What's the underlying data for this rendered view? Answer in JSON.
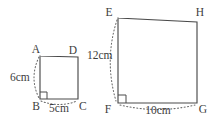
{
  "figure": {
    "background_color": "#ffffff",
    "stroke_color": "#4a4a4a",
    "dotted_color": "#6b6b6b",
    "text_color": "#3d3d3d",
    "shapes": [
      {
        "name": "small-quadrilateral",
        "vertices": [
          {
            "label": "A",
            "x": 40,
            "y": 56,
            "label_x": 36,
            "label_y": 53
          },
          {
            "label": "D",
            "x": 78,
            "y": 57,
            "label_x": 73,
            "label_y": 54
          },
          {
            "label": "C",
            "x": 78,
            "y": 99,
            "label_x": 79,
            "label_y": 110
          },
          {
            "label": "B",
            "x": 40,
            "y": 99,
            "label_x": 30,
            "label_y": 110
          }
        ],
        "right_angle_at": "B",
        "measures": [
          {
            "name": "side-AB",
            "text": "6cm",
            "x": 10,
            "y": 81
          },
          {
            "name": "side-BC",
            "text": "5cm",
            "x": 45,
            "y": 111
          }
        ]
      },
      {
        "name": "large-quadrilateral",
        "vertices": [
          {
            "label": "E",
            "x": 118,
            "y": 18,
            "label_x": 105,
            "label_y": 16
          },
          {
            "label": "H",
            "x": 197,
            "y": 22,
            "label_x": 196,
            "label_y": 16
          },
          {
            "label": "G",
            "x": 197,
            "y": 103,
            "label_x": 199,
            "label_y": 113
          },
          {
            "label": "F",
            "x": 118,
            "y": 103,
            "label_x": 104,
            "label_y": 113
          }
        ],
        "right_angle_at": "F",
        "measures": [
          {
            "name": "side-EF",
            "text": "12cm",
            "x": 87,
            "y": 59
          },
          {
            "name": "side-FG",
            "text": "10cm",
            "x": 143,
            "y": 114
          }
        ]
      }
    ]
  }
}
